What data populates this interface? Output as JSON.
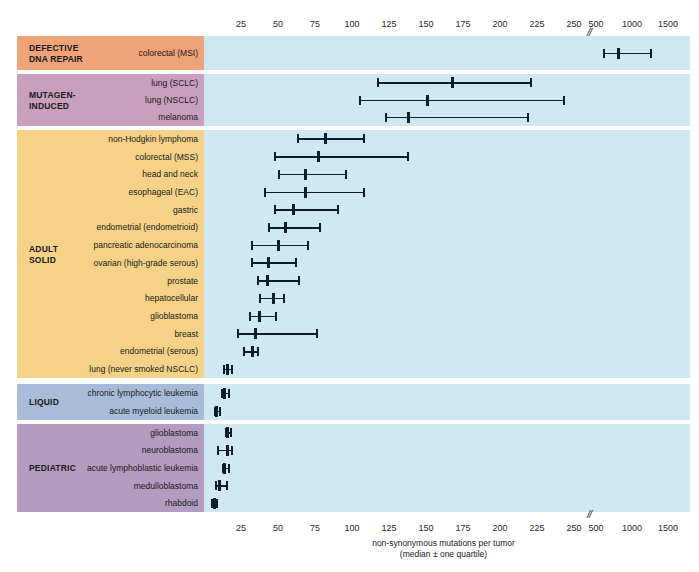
{
  "chart_data": {
    "type": "scatter",
    "title": "",
    "xlabel": "non-synonymous mutations per tumor\n(median ± one quartile)",
    "xlabel_line1": "non-synonymous mutations per tumor",
    "xlabel_line2": "(median ± one quartile)",
    "ylabel": "",
    "axis_break_symbol": "//",
    "ticks": [
      {
        "label": "25",
        "value": 25,
        "x": 241
      },
      {
        "label": "50",
        "value": 50,
        "x": 278
      },
      {
        "label": "75",
        "value": 75,
        "x": 315
      },
      {
        "label": "100",
        "value": 100,
        "x": 352
      },
      {
        "label": "125",
        "value": 125,
        "x": 389
      },
      {
        "label": "150",
        "value": 150,
        "x": 426
      },
      {
        "label": "175",
        "value": 175,
        "x": 463
      },
      {
        "label": "200",
        "value": 200,
        "x": 500
      },
      {
        "label": "225",
        "value": 225,
        "x": 537
      },
      {
        "label": "250",
        "value": 250,
        "x": 574
      },
      {
        "label": "500",
        "value": 500,
        "x": 596
      },
      {
        "label": "1000",
        "value": 1000,
        "x": 632
      },
      {
        "label": "1500",
        "value": 1500,
        "x": 668
      }
    ],
    "axis_break_x": 589,
    "groups": [
      {
        "name": "DEFECTIVE\nDNA REPAIR",
        "color": "#efa378",
        "top": 36,
        "height": 34,
        "rows": [
          {
            "label": "colorectal (MSI)",
            "low": 611,
            "median": 819,
            "high": 1264,
            "px": {
              "low": 603,
              "median": 618,
              "high": 650
            }
          }
        ]
      },
      {
        "name": "MUTAGEN-\nINDUCED",
        "color": "#c9a0bc",
        "top": 74,
        "height": 52,
        "rows": [
          {
            "label": "lung (SCLC)",
            "low": 117,
            "median": 168,
            "high": 220,
            "px": {
              "low": 377,
              "median": 452,
              "high": 530
            }
          },
          {
            "label": "lung (NSCLC)",
            "low": 105,
            "median": 151,
            "high": 243,
            "px": {
              "low": 359,
              "median": 427,
              "high": 563
            }
          },
          {
            "label": "melanoma",
            "low": 122,
            "median": 138,
            "high": 218,
            "px": {
              "low": 385,
              "median": 408,
              "high": 527
            }
          }
        ]
      },
      {
        "name": "ADULT\nSOLID",
        "color": "#f5d287",
        "top": 130,
        "height": 248,
        "rows": [
          {
            "label": "non-Hodgkin lymphoma",
            "low": 63,
            "median": 82,
            "high": 107,
            "px": {
              "low": 297,
              "median": 325,
              "high": 363
            }
          },
          {
            "label": "colorectal (MSS)",
            "low": 47,
            "median": 77,
            "high": 137,
            "px": {
              "low": 274,
              "median": 318,
              "high": 407
            }
          },
          {
            "label": "head and neck",
            "low": 50,
            "median": 68,
            "high": 95,
            "px": {
              "low": 278,
              "median": 305,
              "high": 345
            }
          },
          {
            "label": "esophageal (EAC)",
            "low": 41,
            "median": 68,
            "high": 107,
            "px": {
              "low": 264,
              "median": 305,
              "high": 363
            }
          },
          {
            "label": "gastric",
            "low": 47,
            "median": 60,
            "high": 90,
            "px": {
              "low": 274,
              "median": 293,
              "high": 337
            }
          },
          {
            "label": "endometrial (endometrioid)",
            "low": 43,
            "median": 55,
            "high": 78,
            "px": {
              "low": 268,
              "median": 285,
              "high": 319
            }
          },
          {
            "label": "pancreatic adenocarcinoma",
            "low": 32,
            "median": 50,
            "high": 70,
            "px": {
              "low": 251,
              "median": 278,
              "high": 307
            }
          },
          {
            "label": "ovarian (high-grade serous)",
            "low": 32,
            "median": 43,
            "high": 61,
            "px": {
              "low": 251,
              "median": 268,
              "high": 295
            }
          },
          {
            "label": "prostate",
            "low": 36,
            "median": 43,
            "high": 64,
            "px": {
              "low": 257,
              "median": 267,
              "high": 298
            }
          },
          {
            "label": "hepatocellular",
            "low": 37,
            "median": 47,
            "high": 53,
            "px": {
              "low": 259,
              "median": 273,
              "high": 283
            }
          },
          {
            "label": "glioblastoma",
            "low": 30,
            "median": 37,
            "high": 48,
            "px": {
              "low": 249,
              "median": 259,
              "high": 275
            }
          },
          {
            "label": "breast",
            "low": 22,
            "median": 34,
            "high": 76,
            "px": {
              "low": 237,
              "median": 255,
              "high": 316
            }
          },
          {
            "label": "endometrial (serous)",
            "low": 26,
            "median": 32,
            "high": 36,
            "px": {
              "low": 243,
              "median": 252,
              "high": 257
            }
          },
          {
            "label": "lung (never smoked NSCLC)",
            "low": 13,
            "median": 15,
            "high": 18,
            "px": {
              "low": 223,
              "median": 227,
              "high": 231
            }
          }
        ]
      },
      {
        "name": "LIQUID",
        "color": "#a8bbd8",
        "top": 384,
        "height": 36,
        "rows": [
          {
            "label": "chronic lymphocytic leukemia",
            "low": 11,
            "median": 14,
            "high": 17,
            "px": {
              "low": 221,
              "median": 224,
              "high": 228
            }
          },
          {
            "label": "acute myeloid leukemia",
            "low": 7,
            "median": 8,
            "high": 10,
            "px": {
              "low": 214,
              "median": 216,
              "high": 219
            }
          }
        ]
      },
      {
        "name": "PEDIATRIC",
        "color": "#b49bc0",
        "top": 424,
        "height": 88,
        "rows": [
          {
            "label": "glioblastoma",
            "low": 14,
            "median": 16,
            "high": 18,
            "px": {
              "low": 225,
              "median": 227,
              "high": 230
            }
          },
          {
            "label": "neuroblastoma",
            "low": 9,
            "median": 15,
            "high": 18,
            "px": {
              "low": 217,
              "median": 227,
              "high": 231
            }
          },
          {
            "label": "acute lymphoblastic leukemia",
            "low": 12,
            "median": 14,
            "high": 16,
            "px": {
              "low": 222,
              "median": 224,
              "high": 228
            }
          },
          {
            "label": "medulloblastoma",
            "low": 7,
            "median": 10,
            "high": 15,
            "px": {
              "low": 215,
              "median": 219,
              "high": 226
            }
          },
          {
            "label": "rhabdoid",
            "low": 5,
            "median": 7,
            "high": 8,
            "px": {
              "low": 211,
              "median": 214,
              "high": 216
            }
          }
        ]
      }
    ]
  },
  "colors": {
    "plot_background": "#cfe8f2",
    "marker": "#111b2e",
    "page_background": "#ffffff"
  }
}
